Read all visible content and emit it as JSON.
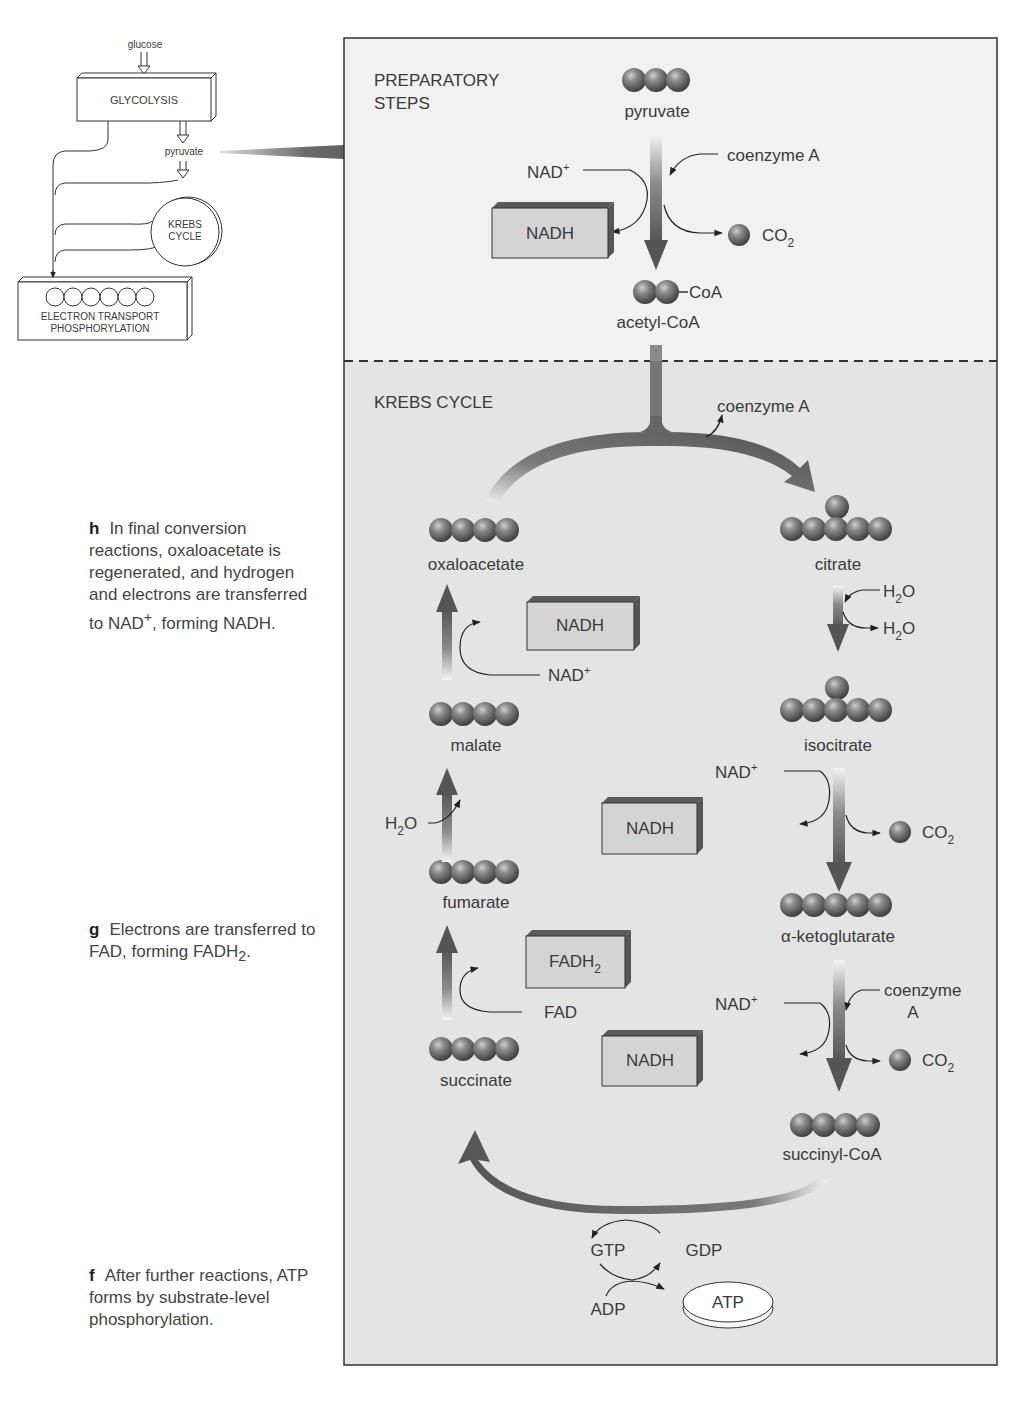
{
  "overview": {
    "glucose": "glucose",
    "glycolysis": "GLYCOLYSIS",
    "pyruvate": "pyruvate",
    "krebs_line1": "KREBS",
    "krebs_line2": "CYCLE",
    "etp_line1": "ELECTRON TRANSPORT",
    "etp_line2": "PHOSPHORYLATION"
  },
  "prep": {
    "title_line1": "PREPARATORY",
    "title_line2": "STEPS",
    "pyruvate": "pyruvate",
    "coenzyme_a": "coenzyme A",
    "nad_plus": "NAD",
    "nadh": "NADH",
    "co2": "CO",
    "coa_tag": "CoA",
    "acetyl_coa": "acetyl-CoA"
  },
  "krebs": {
    "title": "KREBS CYCLE",
    "coenzyme_a_release": "coenzyme A",
    "oxaloacetate": "oxaloacetate",
    "citrate": "citrate",
    "h2o_in": "H",
    "h2o_out": "H",
    "isocitrate": "isocitrate",
    "alpha_ketoglutarate": "α-ketoglutarate",
    "succinyl_coa": "succinyl-CoA",
    "succinate": "succinate",
    "fumarate": "fumarate",
    "malate": "malate",
    "nad_plus": "NAD",
    "nadh": "NADH",
    "co2": "CO",
    "coenzyme_line1": "coenzyme",
    "coenzyme_line2": "A",
    "fad": "FAD",
    "fadh2": "FADH",
    "h2o_malate": "H",
    "gtp": "GTP",
    "gdp": "GDP",
    "adp": "ADP",
    "atp": "ATP"
  },
  "captions": {
    "h": {
      "letter": "h",
      "text": "In final conversion reactions, oxaloacetate is regenerated, and hydrogen and electrons are transferred to NAD",
      "sup": "+",
      "tail": ", forming NADH."
    },
    "g": {
      "letter": "g",
      "text": "Electrons are transferred to FAD, forming FADH",
      "sub": "2",
      "tail": "."
    },
    "f": {
      "letter": "f",
      "text": "After further reactions, ATP forms by substrate-level phosphorylation."
    }
  },
  "colors": {
    "prep_bg": "#f1f1f1",
    "krebs_bg": "#e4e4e4",
    "arrow": "#5e5e5e",
    "sphere": "#6a6a6a",
    "box_face": "#d4d4d4",
    "box_top": "#5a5a5a"
  }
}
